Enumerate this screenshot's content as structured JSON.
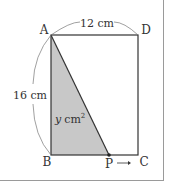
{
  "diagram": {
    "type": "geometry-rectangle-moving-point",
    "points": {
      "A": {
        "label": "A",
        "x": 51,
        "y": 35
      },
      "D": {
        "label": "D",
        "x": 138,
        "y": 35
      },
      "B": {
        "label": "B",
        "x": 51,
        "y": 155
      },
      "C": {
        "label": "C",
        "x": 138,
        "y": 155
      },
      "P": {
        "label": "P",
        "x": 109,
        "y": 155
      }
    },
    "labels": {
      "top_length": "12 cm",
      "left_length": "16 cm",
      "area": "y cm",
      "area_var": "y",
      "area_unit": "cm",
      "area_exp": "2",
      "arrow": "→"
    },
    "colors": {
      "shade": "#c8c8c8",
      "line": "#333333",
      "border": "#9a9a9a"
    }
  }
}
